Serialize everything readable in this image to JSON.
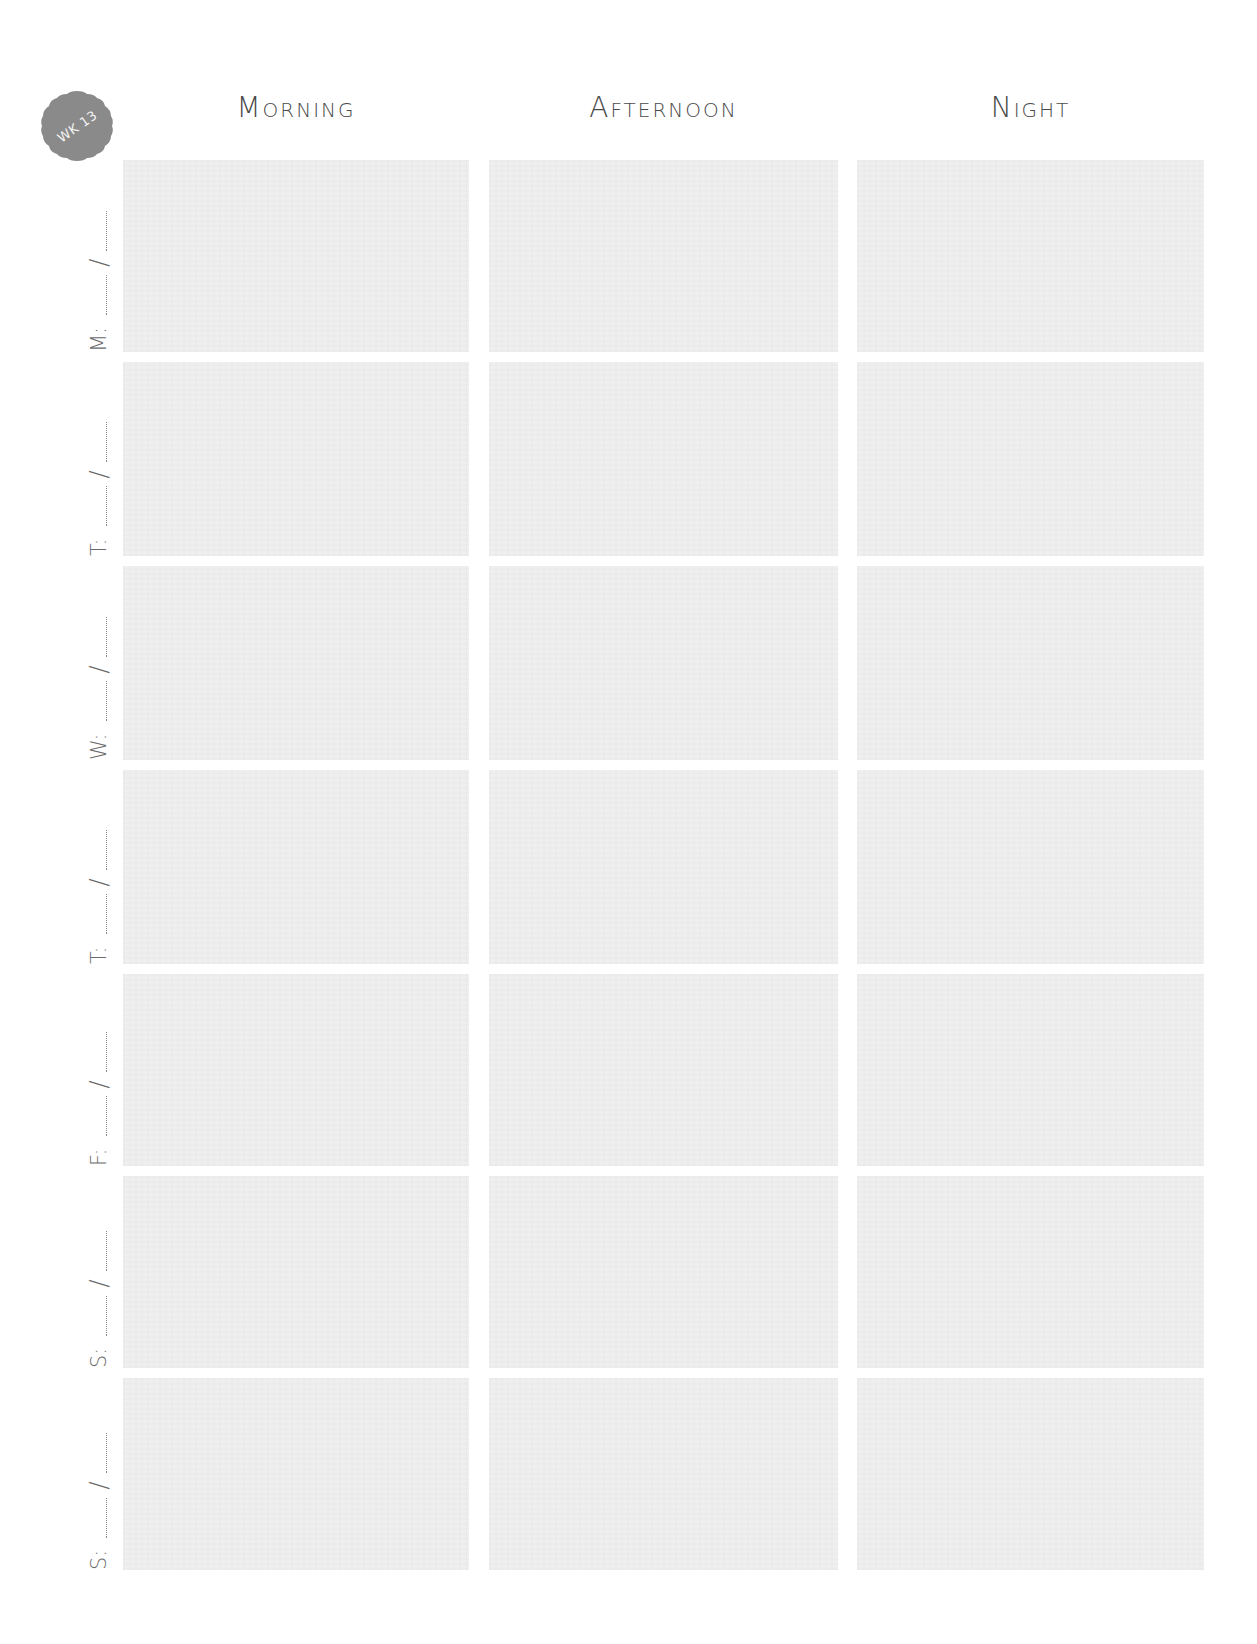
{
  "badge": {
    "label": "WK 13",
    "color": "#8a8a8a",
    "text_color": "#f4f4f4"
  },
  "headers": [
    {
      "label": "Morning"
    },
    {
      "label": "Afternoon"
    },
    {
      "label": "Night"
    }
  ],
  "days": [
    {
      "letter": "M:",
      "separator": "/"
    },
    {
      "letter": "T:",
      "separator": "/"
    },
    {
      "letter": "W:",
      "separator": "/"
    },
    {
      "letter": "T:",
      "separator": "/"
    },
    {
      "letter": "F:",
      "separator": "/"
    },
    {
      "letter": "S:",
      "separator": "/"
    },
    {
      "letter": "S:",
      "separator": "/"
    }
  ],
  "colors": {
    "cell_fill": "#efefef",
    "text": "#4a4a4a",
    "background": "#ffffff"
  }
}
